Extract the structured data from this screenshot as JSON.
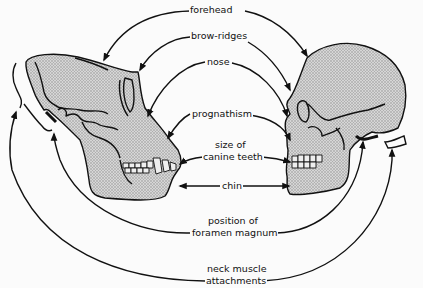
{
  "diagram": {
    "title": "",
    "subjects": [
      {
        "id": "ape",
        "name": "ape-skull",
        "position": "left"
      },
      {
        "id": "human",
        "name": "human-skull",
        "position": "right"
      }
    ],
    "labels": {
      "forehead": "forehead",
      "brow_ridges": "brow-ridges",
      "nose": "nose",
      "prognathism": "prognathism",
      "canine_line1": "size of",
      "canine_line2": "canine teeth",
      "chin": "chin",
      "foramen_line1": "position of",
      "foramen_line2": "foramen magnum",
      "neck_line1": "neck muscle",
      "neck_line2": "attachments"
    },
    "colors": {
      "stroke": "#111111",
      "fill": "#c9c9c9",
      "background": "#fbfbfb"
    }
  }
}
